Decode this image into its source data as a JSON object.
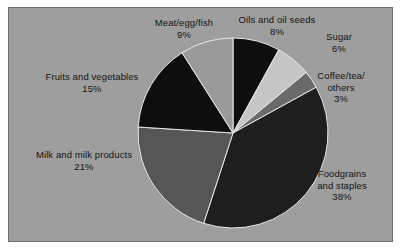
{
  "figure": {
    "background_color": "#ffffff",
    "panel_color": "#9e9e9e",
    "panel_border_color": "#6e6e6e",
    "text_color": "#141414"
  },
  "chart_data": {
    "type": "pie",
    "title": "",
    "xlabel": "",
    "ylabel": "",
    "legend_position": "none",
    "grid": false,
    "start_angle_deg": 90,
    "direction": "clockwise",
    "labels": [
      "Oils and oil seeds",
      "Sugar",
      "Coffee/tea/ others",
      "Foodgrains and staples",
      "Milk and milk products",
      "Fruits and vegetables",
      "Meat/egg/fish"
    ],
    "values": [
      8,
      6,
      3,
      38,
      21,
      15,
      9
    ],
    "value_suffix": "%",
    "total": 100,
    "colors": [
      "#0e0e0e",
      "#c6c6c6",
      "#6a6a6a",
      "#1e1e1e",
      "#565656",
      "#0e0e0e",
      "#9a9a9a"
    ],
    "slices": [
      {
        "name": "oils-and-oil-seeds",
        "label": "Oils and oil seeds",
        "value": 8,
        "value_text": "8%",
        "color": "#0e0e0e"
      },
      {
        "name": "sugar",
        "label": "Sugar",
        "value": 6,
        "value_text": "6%",
        "color": "#c6c6c6"
      },
      {
        "name": "coffee-tea-others",
        "label": "Coffee/tea/ others",
        "value": 3,
        "value_text": "3%",
        "color": "#6a6a6a"
      },
      {
        "name": "foodgrains-staples",
        "label": "Foodgrains and staples",
        "value": 38,
        "value_text": "38%",
        "color": "#1e1e1e"
      },
      {
        "name": "milk-milk-products",
        "label": "Milk and milk products",
        "value": 21,
        "value_text": "21%",
        "color": "#565656"
      },
      {
        "name": "fruits-vegetables",
        "label": "Fruits and vegetables",
        "value": 15,
        "value_text": "15%",
        "color": "#0e0e0e"
      },
      {
        "name": "meat-egg-fish",
        "label": "Meat/egg/fish",
        "value": 9,
        "value_text": "9%",
        "color": "#9a9a9a"
      }
    ]
  },
  "labels": {
    "meat": {
      "line1": "Meat/egg/fish",
      "pct": "9%"
    },
    "oils": {
      "line1": "Oils and oil seeds",
      "pct": "8%"
    },
    "sugar": {
      "line1": "Sugar",
      "pct": "6%"
    },
    "coffee": {
      "line1": "Coffee/tea/",
      "line2": "others",
      "pct": "3%"
    },
    "foodgrain": {
      "line1": "Foodgrains",
      "line2": "and staples",
      "pct": "38%"
    },
    "milk": {
      "line1": "Milk and milk products",
      "pct": "21%"
    },
    "fruits": {
      "line1": "Fruits and vegetables",
      "pct": "15%"
    }
  }
}
